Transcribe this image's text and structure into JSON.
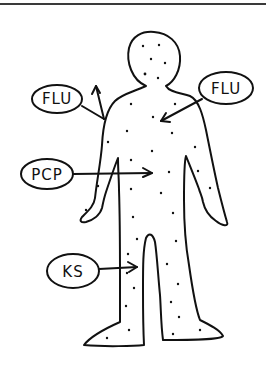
{
  "diagram": {
    "title": "",
    "stroke_color": "#111111",
    "background": "#ffffff",
    "figure": "human-body-outline-with-dots",
    "labels": [
      {
        "id": "flu_left",
        "text": "FLU",
        "target": "upper left shoulder (arrow pointing outward/up)"
      },
      {
        "id": "flu_right",
        "text": "FLU",
        "target": "upper chest"
      },
      {
        "id": "pcp",
        "text": "PCP",
        "target": "torso/abdomen"
      },
      {
        "id": "ks",
        "text": "KS",
        "target": "right leg (viewer's left)"
      }
    ]
  }
}
